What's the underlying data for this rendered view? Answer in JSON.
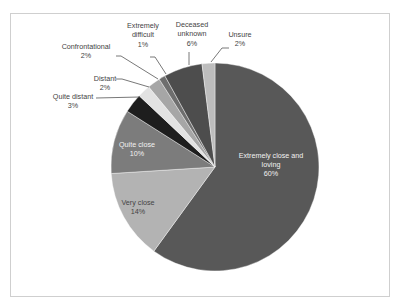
{
  "chart_data": {
    "type": "pie",
    "title": "",
    "start_angle_deg": 0,
    "direction": "clockwise",
    "legend": "none (data labels with leader lines)",
    "slices": [
      {
        "label": "Extremely close and loving",
        "value": 60,
        "display": "60%",
        "color": "#585858"
      },
      {
        "label": "Very close",
        "value": 14,
        "display": "14%",
        "color": "#b3b3b3"
      },
      {
        "label": "Quite close",
        "value": 10,
        "display": "10%",
        "color": "#7c7c7c"
      },
      {
        "label": "Quite distant",
        "value": 3,
        "display": "3%",
        "color": "#1e1e1e"
      },
      {
        "label": "Distant",
        "value": 2,
        "display": "2%",
        "color": "#e2e2e2"
      },
      {
        "label": "Confrontational",
        "value": 2,
        "display": "2%",
        "color": "#a6a6a6"
      },
      {
        "label": "Extremely difficult",
        "value": 1,
        "display": "1%",
        "color": "#6e6e6e"
      },
      {
        "label": "Deceased unknown",
        "value": 6,
        "display": "6%",
        "color": "#4d4d4d"
      },
      {
        "label": "Unsure",
        "value": 2,
        "display": "2%",
        "color": "#bdbdbd"
      }
    ]
  },
  "labels": {
    "extremely_close": {
      "line1": "Extremely close and",
      "line2": "loving",
      "pct": "60%"
    },
    "very_close": {
      "line1": "Very close",
      "pct": "14%"
    },
    "quite_close": {
      "line1": "Quite close",
      "pct": "10%"
    },
    "quite_distant": {
      "line1": "Quite distant",
      "pct": "3%"
    },
    "distant": {
      "line1": "Distant",
      "pct": "2%"
    },
    "confrontational": {
      "line1": "Confrontational",
      "pct": "2%"
    },
    "extremely_difficult": {
      "line1": "Extremely",
      "line2": "difficult",
      "pct": "1%"
    },
    "deceased_unknown": {
      "line1": "Deceased",
      "line2": "unknown",
      "pct": "6%"
    },
    "unsure": {
      "line1": "Unsure",
      "pct": "2%"
    }
  }
}
